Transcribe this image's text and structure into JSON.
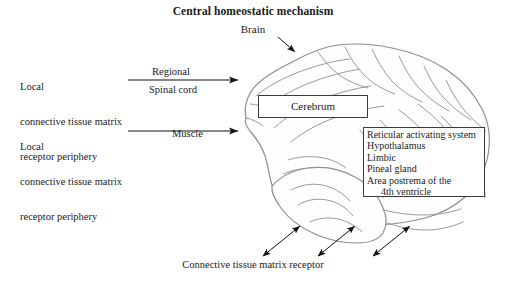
{
  "title": "Central homeostatic mechanism",
  "brain_pointer_label": "Brain",
  "inputs": [
    {
      "label_line1": "Local",
      "label_line2": "connective tissue matrix",
      "label_line3": "receptor periphery",
      "route_above": "Regional",
      "route_below": "Spinal cord"
    },
    {
      "label_line1": "Local",
      "label_line2": "connective tissue matrix",
      "label_line3": "receptor periphery",
      "route_above": "",
      "route_below": "Muscle"
    }
  ],
  "cerebrum_box": {
    "label": "Cerebrum"
  },
  "nuclei_box": {
    "lines": [
      "Reticular activating system",
      "Hypothalamus",
      "Limbic",
      "Pineal gland",
      "Area postrema of the",
      "4th ventricle"
    ]
  },
  "bottom_caption": "Connective tissue matrix receptor",
  "colors": {
    "brain_outline": "#8e8e8e",
    "brain_detail": "#9a9a9a",
    "arrow": "#111111",
    "box_border": "#3a3a3a",
    "text": "#1a1a1a",
    "background": "#ffffff"
  }
}
